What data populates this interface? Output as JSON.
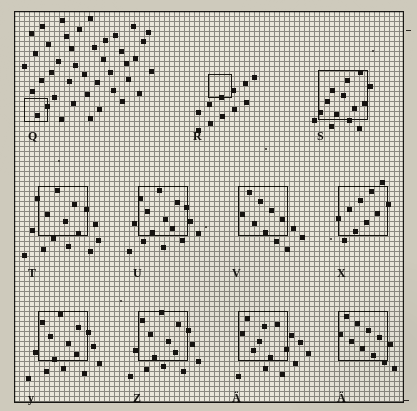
{
  "figure": {
    "paper_color": "#cecabc",
    "grid_color": "#8a8880",
    "major_grid_color": "#171613",
    "mark_color": "#151310",
    "minor_cell_px": 5,
    "major_cell_px": 25,
    "grid_origin": {
      "x": 14,
      "y": 11
    },
    "grid_size": {
      "width": 390,
      "height": 392
    }
  },
  "panels": [
    {
      "id": "Q",
      "label": "Q",
      "label_x": 28,
      "label_y": 130,
      "pattern": "dense-cloud",
      "frame": {
        "x": 24,
        "y": 98,
        "w": 24,
        "h": 24
      }
    },
    {
      "id": "R",
      "label": "R",
      "label_x": 193,
      "label_y": 130,
      "pattern": "two-ascending-segments",
      "frame": {
        "x": 208,
        "y": 74,
        "w": 24,
        "h": 24
      }
    },
    {
      "id": "S",
      "label": "S",
      "label_x": 317,
      "label_y": 130,
      "pattern": "noisy-descending",
      "frame": {
        "x": 318,
        "y": 70,
        "w": 50,
        "h": 50
      }
    },
    {
      "id": "T",
      "label": "T",
      "label_x": 28,
      "label_y": 267,
      "pattern": "noisy-descending",
      "frame": {
        "x": 38,
        "y": 186,
        "w": 50,
        "h": 50
      }
    },
    {
      "id": "U",
      "label": "U",
      "label_x": 133,
      "label_y": 267,
      "pattern": "dense-cloud",
      "frame": {
        "x": 138,
        "y": 186,
        "w": 50,
        "h": 50
      }
    },
    {
      "id": "V",
      "label": "V",
      "label_x": 232,
      "label_y": 267,
      "pattern": "two-descending-segments",
      "frame": {
        "x": 238,
        "y": 186,
        "w": 50,
        "h": 50
      }
    },
    {
      "id": "X",
      "label": "X",
      "label_x": 337,
      "label_y": 267,
      "pattern": "two-ascending-segments",
      "frame": {
        "x": 338,
        "y": 186,
        "w": 50,
        "h": 50
      }
    },
    {
      "id": "y",
      "label": "y",
      "label_x": 28,
      "label_y": 392,
      "pattern": "dense-cloud",
      "frame": {
        "x": 38,
        "y": 311,
        "w": 50,
        "h": 50
      }
    },
    {
      "id": "Z",
      "label": "Z",
      "label_x": 133,
      "label_y": 392,
      "pattern": "dense-cloud",
      "frame": {
        "x": 138,
        "y": 311,
        "w": 50,
        "h": 50
      }
    },
    {
      "id": "A1",
      "label": "Ä",
      "label_x": 232,
      "label_y": 392,
      "pattern": "noisy-descending",
      "frame": {
        "x": 238,
        "y": 311,
        "w": 50,
        "h": 50
      }
    },
    {
      "id": "A2",
      "label": "Ä",
      "label_x": 337,
      "label_y": 392,
      "pattern": "clean-descending",
      "frame": {
        "x": 338,
        "y": 311,
        "w": 50,
        "h": 50
      }
    }
  ],
  "chart_data": {
    "type": "scatter",
    "xlabel": "",
    "ylabel": "",
    "grid": true,
    "legend": "none",
    "panel_labels": [
      "Q",
      "R",
      "S",
      "T",
      "U",
      "V",
      "X",
      "y",
      "Z",
      "Ä",
      "Ä"
    ],
    "marks_px": [
      [
        40,
        24
      ],
      [
        60,
        18
      ],
      [
        88,
        16
      ],
      [
        103,
        38
      ],
      [
        131,
        24
      ],
      [
        141,
        39
      ],
      [
        29,
        31
      ],
      [
        46,
        42
      ],
      [
        77,
        27
      ],
      [
        69,
        46
      ],
      [
        113,
        33
      ],
      [
        146,
        30
      ],
      [
        33,
        51
      ],
      [
        56,
        59
      ],
      [
        64,
        34
      ],
      [
        92,
        45
      ],
      [
        119,
        49
      ],
      [
        124,
        61
      ],
      [
        22,
        64
      ],
      [
        49,
        70
      ],
      [
        73,
        63
      ],
      [
        82,
        72
      ],
      [
        101,
        57
      ],
      [
        133,
        56
      ],
      [
        39,
        78
      ],
      [
        67,
        79
      ],
      [
        95,
        80
      ],
      [
        108,
        70
      ],
      [
        126,
        77
      ],
      [
        149,
        69
      ],
      [
        30,
        89
      ],
      [
        52,
        95
      ],
      [
        85,
        92
      ],
      [
        111,
        88
      ],
      [
        137,
        91
      ],
      [
        45,
        104
      ],
      [
        71,
        101
      ],
      [
        97,
        107
      ],
      [
        120,
        99
      ],
      [
        35,
        113
      ],
      [
        59,
        117
      ],
      [
        88,
        116
      ],
      [
        196,
        110
      ],
      [
        207,
        102
      ],
      [
        219,
        95
      ],
      [
        231,
        88
      ],
      [
        243,
        81
      ],
      [
        252,
        75
      ],
      [
        196,
        128
      ],
      [
        208,
        121
      ],
      [
        220,
        114
      ],
      [
        232,
        107
      ],
      [
        244,
        100
      ],
      [
        330,
        88
      ],
      [
        345,
        78
      ],
      [
        358,
        70
      ],
      [
        325,
        99
      ],
      [
        341,
        93
      ],
      [
        352,
        106
      ],
      [
        318,
        110
      ],
      [
        334,
        112
      ],
      [
        347,
        118
      ],
      [
        362,
        101
      ],
      [
        329,
        124
      ],
      [
        357,
        126
      ],
      [
        312,
        118
      ],
      [
        368,
        84
      ],
      [
        35,
        196
      ],
      [
        55,
        188
      ],
      [
        72,
        202
      ],
      [
        45,
        212
      ],
      [
        63,
        219
      ],
      [
        84,
        207
      ],
      [
        30,
        228
      ],
      [
        51,
        236
      ],
      [
        76,
        231
      ],
      [
        93,
        222
      ],
      [
        66,
        244
      ],
      [
        88,
        249
      ],
      [
        22,
        253
      ],
      [
        41,
        247
      ],
      [
        96,
        238
      ],
      [
        138,
        196
      ],
      [
        157,
        188
      ],
      [
        175,
        200
      ],
      [
        145,
        209
      ],
      [
        163,
        217
      ],
      [
        184,
        205
      ],
      [
        132,
        221
      ],
      [
        150,
        230
      ],
      [
        170,
        226
      ],
      [
        188,
        219
      ],
      [
        141,
        239
      ],
      [
        161,
        245
      ],
      [
        127,
        249
      ],
      [
        180,
        238
      ],
      [
        196,
        231
      ],
      [
        247,
        190
      ],
      [
        258,
        199
      ],
      [
        269,
        208
      ],
      [
        280,
        217
      ],
      [
        291,
        226
      ],
      [
        300,
        235
      ],
      [
        240,
        212
      ],
      [
        252,
        221
      ],
      [
        263,
        230
      ],
      [
        274,
        239
      ],
      [
        285,
        247
      ],
      [
        342,
        238
      ],
      [
        353,
        229
      ],
      [
        364,
        220
      ],
      [
        375,
        211
      ],
      [
        386,
        202
      ],
      [
        336,
        216
      ],
      [
        347,
        207
      ],
      [
        358,
        198
      ],
      [
        369,
        189
      ],
      [
        380,
        180
      ],
      [
        40,
        320
      ],
      [
        58,
        312
      ],
      [
        76,
        325
      ],
      [
        48,
        334
      ],
      [
        66,
        341
      ],
      [
        86,
        330
      ],
      [
        33,
        350
      ],
      [
        52,
        357
      ],
      [
        74,
        352
      ],
      [
        91,
        344
      ],
      [
        61,
        366
      ],
      [
        82,
        371
      ],
      [
        26,
        376
      ],
      [
        44,
        369
      ],
      [
        97,
        361
      ],
      [
        140,
        318
      ],
      [
        159,
        310
      ],
      [
        176,
        322
      ],
      [
        148,
        332
      ],
      [
        166,
        339
      ],
      [
        186,
        328
      ],
      [
        133,
        348
      ],
      [
        152,
        355
      ],
      [
        173,
        350
      ],
      [
        190,
        342
      ],
      [
        161,
        364
      ],
      [
        181,
        369
      ],
      [
        128,
        374
      ],
      [
        144,
        367
      ],
      [
        196,
        359
      ],
      [
        245,
        316
      ],
      [
        262,
        324
      ],
      [
        240,
        331
      ],
      [
        257,
        339
      ],
      [
        275,
        322
      ],
      [
        289,
        333
      ],
      [
        251,
        348
      ],
      [
        268,
        355
      ],
      [
        284,
        347
      ],
      [
        298,
        340
      ],
      [
        263,
        366
      ],
      [
        280,
        372
      ],
      [
        236,
        374
      ],
      [
        293,
        361
      ],
      [
        306,
        351
      ],
      [
        344,
        314
      ],
      [
        355,
        321
      ],
      [
        366,
        328
      ],
      [
        377,
        335
      ],
      [
        388,
        342
      ],
      [
        338,
        332
      ],
      [
        349,
        339
      ],
      [
        360,
        346
      ],
      [
        371,
        353
      ],
      [
        382,
        360
      ],
      [
        392,
        366
      ]
    ]
  },
  "annotations": {
    "corner_tick": "tick-mark",
    "edge_tick": "tick-mark"
  }
}
